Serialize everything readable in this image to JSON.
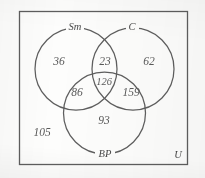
{
  "diagram": {
    "universe_label": "U",
    "sets": [
      {
        "id": "Sm",
        "label": "Sm",
        "position": "top-left"
      },
      {
        "id": "C",
        "label": "C",
        "position": "top-right"
      },
      {
        "id": "BP",
        "label": "BP",
        "position": "bottom"
      }
    ],
    "regions": [
      {
        "id": "Sm-only",
        "label": "36",
        "value": 36
      },
      {
        "id": "Sm-and-C",
        "label": "23",
        "value": 23
      },
      {
        "id": "C-only",
        "label": "62",
        "value": 62
      },
      {
        "id": "Sm-and-C-and-BP",
        "label": "126",
        "value": 126
      },
      {
        "id": "Sm-and-BP",
        "label": "86",
        "value": 86
      },
      {
        "id": "C-and-BP",
        "label": "159",
        "value": 159
      },
      {
        "id": "BP-only",
        "label": "93",
        "value": 93
      },
      {
        "id": "outside-all",
        "label": "105",
        "value": 105
      }
    ]
  },
  "style": {
    "stroke_color": "#5e5e5e",
    "text_color": "#5a5a5a",
    "background_color": "#fdfdfc"
  }
}
